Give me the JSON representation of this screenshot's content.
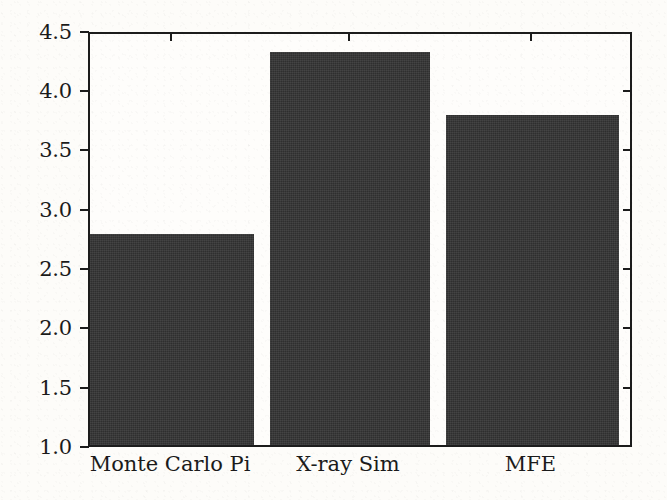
{
  "chart_data": {
    "type": "bar",
    "title": "",
    "xlabel": "",
    "ylabel": "Speedup",
    "categories": [
      "Monte Carlo Pi",
      "X-ray Sim",
      "MFE"
    ],
    "values": [
      2.8,
      4.35,
      3.81
    ],
    "ylim": [
      1.0,
      4.5
    ],
    "ytick_labels": [
      "1.0",
      "1.5",
      "2.0",
      "2.5",
      "3.0",
      "3.5",
      "4.0",
      "4.5"
    ],
    "ytick_values": [
      1.0,
      1.5,
      2.0,
      2.5,
      3.0,
      3.5,
      4.0,
      4.5
    ],
    "grid": false,
    "legend": null,
    "bar_color": "#343434",
    "axis_color": "#1c1c1c",
    "background_color": "#fdfcf9"
  },
  "axis": {
    "y_title": "Speedup",
    "ticks": [
      {
        "label": "4.5",
        "value": 4.5
      },
      {
        "label": "4.0",
        "value": 4.0
      },
      {
        "label": "3.5",
        "value": 3.5
      },
      {
        "label": "3.0",
        "value": 3.0
      },
      {
        "label": "2.5",
        "value": 2.5
      },
      {
        "label": "2.0",
        "value": 2.0
      },
      {
        "label": "1.5",
        "value": 1.5
      },
      {
        "label": "1.0",
        "value": 1.0
      }
    ]
  },
  "bars": [
    {
      "label": "Monte Carlo Pi",
      "value": 2.8
    },
    {
      "label": "X-ray Sim",
      "value": 4.35
    },
    {
      "label": "MFE",
      "value": 3.81
    }
  ]
}
